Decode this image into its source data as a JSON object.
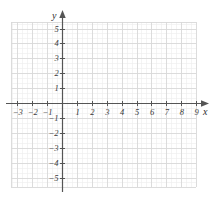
{
  "figure": {
    "kind": "cartesian-coordinate-grid",
    "background_color": "#ffffff",
    "width": 218,
    "height": 197
  },
  "chart_data": {
    "type": "scatter",
    "title": "",
    "xlabel": "x",
    "ylabel": "y",
    "series": [],
    "grid": true,
    "legend": null,
    "xlim": [
      -3.4,
      9.9
    ],
    "ylim": [
      -5.4,
      5.6
    ],
    "x_major_step": 1,
    "y_major_step": 1,
    "minor_per_major": 3,
    "x_tick_labels": [
      "-3",
      "-2",
      "-1",
      "1",
      "2",
      "3",
      "4",
      "5",
      "6",
      "7",
      "8",
      "9"
    ],
    "y_tick_labels": [
      "5",
      "4",
      "3",
      "2",
      "1",
      "-1",
      "-2",
      "-3",
      "-4",
      "-5"
    ],
    "x_tick_values": [
      -3,
      -2,
      -1,
      1,
      2,
      3,
      4,
      5,
      6,
      7,
      8,
      9
    ],
    "y_tick_values": [
      5,
      4,
      3,
      2,
      1,
      -1,
      -2,
      -3,
      -4,
      -5
    ],
    "origin_label": ""
  },
  "axes": {
    "x_axis_label": "x",
    "y_axis_label": "y",
    "axis_color": "#555555",
    "major_grid_color": "#d8d8d8",
    "minor_grid_color": "#ededed",
    "tick_text_color": "#3b3b3b"
  },
  "x_ticks": [
    {
      "label": "-3",
      "value": -3
    },
    {
      "label": "-2",
      "value": -2
    },
    {
      "label": "-1",
      "value": -1
    },
    {
      "label": "1",
      "value": 1
    },
    {
      "label": "2",
      "value": 2
    },
    {
      "label": "3",
      "value": 3
    },
    {
      "label": "4",
      "value": 4
    },
    {
      "label": "5",
      "value": 5
    },
    {
      "label": "6",
      "value": 6
    },
    {
      "label": "7",
      "value": 7
    },
    {
      "label": "8",
      "value": 8
    },
    {
      "label": "9",
      "value": 9
    }
  ],
  "y_ticks": [
    {
      "label": "5",
      "value": 5
    },
    {
      "label": "4",
      "value": 4
    },
    {
      "label": "3",
      "value": 3
    },
    {
      "label": "2",
      "value": 2
    },
    {
      "label": "1",
      "value": 1
    },
    {
      "label": "-1",
      "value": -1
    },
    {
      "label": "-2",
      "value": -2
    },
    {
      "label": "-3",
      "value": -3
    },
    {
      "label": "-4",
      "value": -4
    },
    {
      "label": "-5",
      "value": -5
    }
  ]
}
